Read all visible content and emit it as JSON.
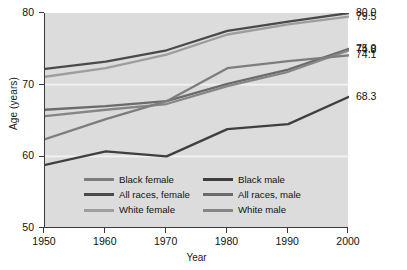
{
  "chart_data": {
    "type": "line",
    "title": "",
    "xlabel": "Year",
    "ylabel": "Age (years)",
    "x": [
      1950,
      1960,
      1970,
      1980,
      1990,
      2000
    ],
    "xlim": [
      1950,
      2000
    ],
    "ylim": [
      50,
      80
    ],
    "xticks": [
      "1950",
      "1960",
      "1970",
      "1980",
      "1990",
      "2000"
    ],
    "yticks": [
      "50",
      "60",
      "70",
      "80"
    ],
    "grid": false,
    "legend_position": "inside-bottom-center",
    "series": [
      {
        "name": "All races, female",
        "color": "#4a4a4a",
        "values": [
          72.2,
          73.2,
          74.8,
          77.5,
          78.8,
          80.0
        ],
        "end_label": "80.0"
      },
      {
        "name": "White female",
        "color": "#9e9e9e",
        "values": [
          71.1,
          72.3,
          74.2,
          77.0,
          78.4,
          79.5
        ],
        "end_label": "79.5"
      },
      {
        "name": "All races, male",
        "color": "#6b6b6b",
        "values": [
          66.5,
          67.0,
          67.7,
          70.1,
          72.1,
          75.0
        ],
        "end_label": "75.0"
      },
      {
        "name": "White male",
        "color": "#868686",
        "values": [
          65.6,
          66.5,
          67.3,
          69.8,
          71.8,
          74.8
        ],
        "end_label": "74.8"
      },
      {
        "name": "Black female",
        "color": "#7d7d7d",
        "values": [
          62.4,
          65.2,
          67.7,
          72.3,
          73.3,
          74.1
        ],
        "end_label": "74.1"
      },
      {
        "name": "Black male",
        "color": "#3f3f3f",
        "values": [
          58.8,
          60.7,
          60.0,
          63.8,
          64.5,
          68.3
        ],
        "end_label": "68.3"
      }
    ],
    "end_labels": [
      "80.0",
      "79.5",
      "75.0",
      "74.8",
      "74.1",
      "68.3"
    ],
    "legend": [
      {
        "label": "Black female",
        "color": "#7d7d7d",
        "column": "left"
      },
      {
        "label": "Black male",
        "color": "#3f3f3f",
        "column": "right"
      },
      {
        "label": "All races, female",
        "color": "#4a4a4a",
        "column": "left"
      },
      {
        "label": "All races, male",
        "color": "#6b6b6b",
        "column": "right"
      },
      {
        "label": "White female",
        "color": "#9e9e9e",
        "column": "left"
      },
      {
        "label": "White male",
        "color": "#868686",
        "column": "right"
      }
    ],
    "plot_background": "#dcdcdc",
    "axis_color": "#3a3a3a"
  }
}
